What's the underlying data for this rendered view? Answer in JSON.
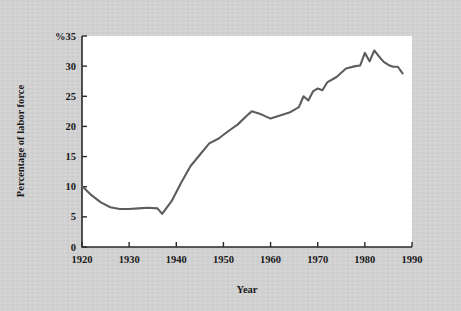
{
  "figure": {
    "background_color": "#d4d4d4",
    "plot_background_color": "#ffffff",
    "line_color": "#5d5d5d",
    "axis_color": "#2a2a2a"
  },
  "chart_data": {
    "type": "line",
    "title": "",
    "subtitle": "",
    "xlabel": "Year",
    "ylabel": "Percentage of labor force",
    "y_unit_prefix": "%",
    "y_top_label": "%35",
    "xlim": [
      1920,
      1990
    ],
    "ylim": [
      0,
      35
    ],
    "grid": false,
    "legend": null,
    "xticks": [
      1920,
      1930,
      1940,
      1950,
      1960,
      1970,
      1980,
      1990
    ],
    "xtick_labels": [
      "1920",
      "1930",
      "1940",
      "1950",
      "1960",
      "1970",
      "1980",
      "1990"
    ],
    "yticks": [
      0,
      5,
      10,
      15,
      20,
      25,
      30,
      35
    ],
    "ytick_labels": [
      "0",
      "5",
      "10",
      "15",
      "20",
      "25",
      "30",
      "%35"
    ],
    "series": [
      {
        "name": "Percentage of labor force",
        "color": "#5d5d5d",
        "x": [
          1920,
          1922,
          1924,
          1926,
          1928,
          1930,
          1932,
          1934,
          1936,
          1937,
          1939,
          1941,
          1943,
          1945,
          1947,
          1949,
          1951,
          1953,
          1955,
          1956,
          1958,
          1960,
          1962,
          1964,
          1966,
          1967,
          1968,
          1969,
          1970,
          1971,
          1972,
          1974,
          1976,
          1978,
          1979,
          1980,
          1981,
          1982,
          1983,
          1984,
          1985,
          1986,
          1987,
          1988
        ],
        "y": [
          10.1,
          8.6,
          7.4,
          6.6,
          6.3,
          6.3,
          6.4,
          6.5,
          6.4,
          5.5,
          7.6,
          10.6,
          13.4,
          15.3,
          17.2,
          18.0,
          19.2,
          20.3,
          21.8,
          22.5,
          22.0,
          21.3,
          21.8,
          22.3,
          23.2,
          25.0,
          24.3,
          25.8,
          26.3,
          26.0,
          27.3,
          28.2,
          29.6,
          30.0,
          30.1,
          32.2,
          30.8,
          32.6,
          31.6,
          30.7,
          30.2,
          29.9,
          29.9,
          28.8
        ]
      }
    ]
  },
  "axis": {
    "x_title": "Year",
    "y_title": "Percentage of labor force"
  }
}
